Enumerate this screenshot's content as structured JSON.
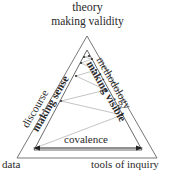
{
  "diagram": {
    "apex": {
      "label": "theory",
      "sublabel": "making validity"
    },
    "left_side": {
      "label": "discourse",
      "sublabel": "making sense"
    },
    "right_side": {
      "label": "methodology",
      "sublabel": "making visible"
    },
    "bottom_left_corner": "data",
    "bottom_right_corner": "tools of inquiry",
    "base_arrow_label": "covalence",
    "colors": {
      "outer_triangle": "#555555",
      "inner_triangle": "#444444",
      "zigzag": "#aaaaaa",
      "arrow": "#222222",
      "text": "#2a2a2a"
    },
    "zigzag_points": [
      [
        35,
        148
      ],
      [
        122,
        115
      ],
      [
        61,
        101
      ],
      [
        106,
        90
      ],
      [
        76,
        76
      ],
      [
        96,
        70
      ],
      [
        81,
        63
      ],
      [
        92,
        59
      ],
      [
        84,
        57
      ],
      [
        89,
        56
      ]
    ]
  }
}
